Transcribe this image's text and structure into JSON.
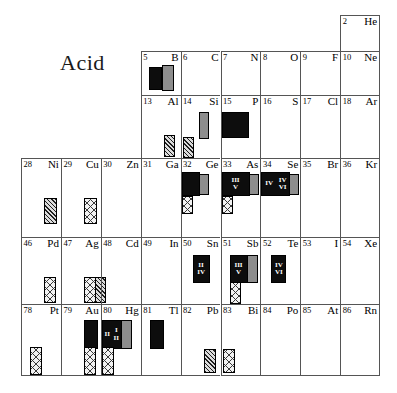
{
  "figure": {
    "title": "Acid",
    "type": "periodic-table-fragment",
    "columns": 9,
    "rows": 5
  },
  "colors": {
    "grid_line": "#555555",
    "black_fill": "#0d0d0d",
    "stipple_fill": "#8d8d8d",
    "hatch_fill": "#dcdcdc",
    "crosshatch_fill": "#f2f2f2",
    "text": "#000000"
  },
  "legend_patterns": [
    {
      "name": "black",
      "label": "solid black bar"
    },
    {
      "name": "stipple",
      "label": "stippled/dotted bar"
    },
    {
      "name": "hatch",
      "label": "diagonal hatched bar"
    },
    {
      "name": "crosshatch",
      "label": "cross-hatched bar"
    }
  ],
  "cells": [
    {
      "row": 0,
      "col": 8,
      "number": "2",
      "symbol": "He",
      "bars": []
    },
    {
      "row": 1,
      "col": 3,
      "number": "5",
      "symbol": "B",
      "bars": [
        {
          "pattern": "black",
          "x": 7,
          "y": 4,
          "w": 13,
          "h": 23,
          "marks": []
        },
        {
          "pattern": "stipple",
          "x": 20,
          "y": 2,
          "w": 12,
          "h": 26,
          "marks": []
        }
      ]
    },
    {
      "row": 1,
      "col": 4,
      "number": "6",
      "symbol": "C",
      "bars": []
    },
    {
      "row": 1,
      "col": 5,
      "number": "7",
      "symbol": "N",
      "bars": []
    },
    {
      "row": 1,
      "col": 6,
      "number": "8",
      "symbol": "O",
      "bars": []
    },
    {
      "row": 1,
      "col": 7,
      "number": "9",
      "symbol": "F",
      "bars": []
    },
    {
      "row": 1,
      "col": 8,
      "number": "10",
      "symbol": "Ne",
      "bars": []
    },
    {
      "row": 2,
      "col": 3,
      "number": "13",
      "symbol": "Al",
      "bars": [
        {
          "pattern": "hatch",
          "x": 22,
          "y": 28,
          "w": 11,
          "h": 22,
          "marks": []
        }
      ]
    },
    {
      "row": 2,
      "col": 4,
      "number": "14",
      "symbol": "Si",
      "bars": [
        {
          "pattern": "stipple",
          "x": 17,
          "y": 5,
          "w": 10,
          "h": 27,
          "marks": []
        },
        {
          "pattern": "hatch",
          "x": 1,
          "y": 30,
          "w": 11,
          "h": 21,
          "marks": []
        }
      ]
    },
    {
      "row": 2,
      "col": 5,
      "number": "15",
      "symbol": "P",
      "bars": [
        {
          "pattern": "black",
          "x": 0,
          "y": 5,
          "w": 27,
          "h": 26,
          "marks": []
        }
      ]
    },
    {
      "row": 2,
      "col": 6,
      "number": "16",
      "symbol": "S",
      "bars": []
    },
    {
      "row": 2,
      "col": 7,
      "number": "17",
      "symbol": "Cl",
      "bars": []
    },
    {
      "row": 2,
      "col": 8,
      "number": "18",
      "symbol": "Ar",
      "bars": []
    },
    {
      "row": 3,
      "col": 0,
      "number": "28",
      "symbol": "Ni",
      "bars": [
        {
          "pattern": "hatch",
          "x": 22,
          "y": 28,
          "w": 13,
          "h": 26,
          "marks": []
        }
      ]
    },
    {
      "row": 3,
      "col": 1,
      "number": "29",
      "symbol": "Cu",
      "bars": [
        {
          "pattern": "cross",
          "x": 22,
          "y": 28,
          "w": 13,
          "h": 26,
          "marks": []
        }
      ]
    },
    {
      "row": 3,
      "col": 2,
      "number": "30",
      "symbol": "Zn",
      "bars": []
    },
    {
      "row": 3,
      "col": 3,
      "number": "31",
      "symbol": "Ga",
      "bars": []
    },
    {
      "row": 3,
      "col": 4,
      "number": "32",
      "symbol": "Ge",
      "bars": [
        {
          "pattern": "black",
          "x": 0,
          "y": 2,
          "w": 18,
          "h": 24,
          "marks": []
        },
        {
          "pattern": "stipple",
          "x": 17,
          "y": 4,
          "w": 10,
          "h": 21,
          "marks": []
        },
        {
          "pattern": "cross",
          "x": 0,
          "y": 26,
          "w": 11,
          "h": 18,
          "marks": []
        }
      ]
    },
    {
      "row": 3,
      "col": 5,
      "number": "33",
      "symbol": "As",
      "bars": [
        {
          "pattern": "black",
          "x": 0,
          "y": 2,
          "w": 28,
          "h": 24,
          "marks": [
            "III",
            "V"
          ]
        },
        {
          "pattern": "stipple",
          "x": 27,
          "y": 4,
          "w": 10,
          "h": 21,
          "marks": []
        },
        {
          "pattern": "cross",
          "x": 0,
          "y": 26,
          "w": 11,
          "h": 18,
          "marks": []
        }
      ]
    },
    {
      "row": 3,
      "col": 6,
      "number": "34",
      "symbol": "Se",
      "bars": [
        {
          "pattern": "black",
          "x": 0,
          "y": 2,
          "w": 29,
          "h": 24,
          "marks": [
            "IV",
            "IV",
            "VI"
          ]
        },
        {
          "pattern": "stipple",
          "x": 28,
          "y": 4,
          "w": 10,
          "h": 21,
          "marks": []
        }
      ]
    },
    {
      "row": 3,
      "col": 7,
      "number": "35",
      "symbol": "Br",
      "bars": []
    },
    {
      "row": 3,
      "col": 8,
      "number": "36",
      "symbol": "Kr",
      "bars": []
    },
    {
      "row": 4,
      "col": 0,
      "number": "46",
      "symbol": "Pd",
      "bars": [
        {
          "pattern": "cross",
          "x": 22,
          "y": 28,
          "w": 12,
          "h": 26,
          "marks": []
        }
      ]
    },
    {
      "row": 4,
      "col": 1,
      "number": "47",
      "symbol": "Ag",
      "bars": [
        {
          "pattern": "cross",
          "x": 22,
          "y": 28,
          "w": 12,
          "h": 26,
          "marks": []
        },
        {
          "pattern": "hatch",
          "x": 33,
          "y": 28,
          "w": 11,
          "h": 26,
          "marks": []
        }
      ]
    },
    {
      "row": 4,
      "col": 2,
      "number": "48",
      "symbol": "Cd",
      "bars": []
    },
    {
      "row": 4,
      "col": 3,
      "number": "49",
      "symbol": "In",
      "bars": []
    },
    {
      "row": 4,
      "col": 4,
      "number": "50",
      "symbol": "Sn",
      "bars": [
        {
          "pattern": "black",
          "x": 11,
          "y": 6,
          "w": 17,
          "h": 28,
          "marks": [
            "II",
            "IV"
          ]
        }
      ]
    },
    {
      "row": 4,
      "col": 5,
      "number": "51",
      "symbol": "Sb",
      "bars": [
        {
          "pattern": "black",
          "x": 8,
          "y": 6,
          "w": 18,
          "h": 28,
          "marks": [
            "III",
            "V"
          ]
        },
        {
          "pattern": "stipple",
          "x": 25,
          "y": 6,
          "w": 11,
          "h": 28,
          "marks": []
        },
        {
          "pattern": "cross",
          "x": 8,
          "y": 33,
          "w": 11,
          "h": 22,
          "marks": []
        }
      ]
    },
    {
      "row": 4,
      "col": 6,
      "number": "52",
      "symbol": "Te",
      "bars": [
        {
          "pattern": "black",
          "x": 10,
          "y": 6,
          "w": 15,
          "h": 28,
          "marks": [
            "IV",
            "VI"
          ]
        }
      ]
    },
    {
      "row": 4,
      "col": 7,
      "number": "53",
      "symbol": "I",
      "bars": []
    },
    {
      "row": 4,
      "col": 8,
      "number": "54",
      "symbol": "Xe",
      "bars": []
    },
    {
      "row": 5,
      "col": 0,
      "number": "78",
      "symbol": "Pt",
      "bars": [
        {
          "pattern": "cross",
          "x": 8,
          "y": 31,
          "w": 12,
          "h": 28,
          "marks": []
        }
      ]
    },
    {
      "row": 5,
      "col": 1,
      "number": "79",
      "symbol": "Au",
      "bars": [
        {
          "pattern": "black",
          "x": 22,
          "y": 4,
          "w": 14,
          "h": 29,
          "marks": []
        },
        {
          "pattern": "cross",
          "x": 22,
          "y": 31,
          "w": 12,
          "h": 28,
          "marks": []
        }
      ]
    },
    {
      "row": 5,
      "col": 2,
      "number": "80",
      "symbol": "Hg",
      "bars": [
        {
          "pattern": "black",
          "x": 0,
          "y": 4,
          "w": 20,
          "h": 29,
          "marks": [
            "II",
            "I",
            "II"
          ]
        },
        {
          "pattern": "stipple",
          "x": 19,
          "y": 4,
          "w": 11,
          "h": 29,
          "marks": []
        },
        {
          "pattern": "cross",
          "x": 0,
          "y": 31,
          "w": 12,
          "h": 28,
          "marks": []
        }
      ]
    },
    {
      "row": 5,
      "col": 3,
      "number": "81",
      "symbol": "Tl",
      "bars": [
        {
          "pattern": "black",
          "x": 8,
          "y": 4,
          "w": 14,
          "h": 29,
          "marks": []
        }
      ]
    },
    {
      "row": 5,
      "col": 4,
      "number": "82",
      "symbol": "Pb",
      "bars": [
        {
          "pattern": "hatch",
          "x": 22,
          "y": 33,
          "w": 12,
          "h": 24,
          "marks": []
        }
      ]
    },
    {
      "row": 5,
      "col": 5,
      "number": "83",
      "symbol": "Bi",
      "bars": [
        {
          "pattern": "cross",
          "x": 1,
          "y": 33,
          "w": 12,
          "h": 24,
          "marks": []
        }
      ]
    },
    {
      "row": 5,
      "col": 6,
      "number": "84",
      "symbol": "Po",
      "bars": []
    },
    {
      "row": 5,
      "col": 7,
      "number": "85",
      "symbol": "At",
      "bars": []
    },
    {
      "row": 5,
      "col": 8,
      "number": "86",
      "symbol": "Rn",
      "bars": []
    }
  ]
}
